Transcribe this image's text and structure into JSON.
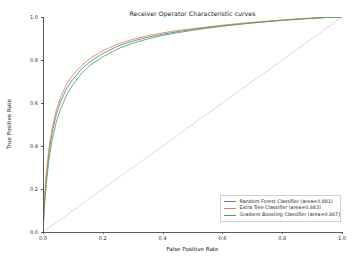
{
  "chart_data": {
    "type": "line",
    "title": "Receiver Operator Characteristic curves",
    "xlabel": "False Positive Rate",
    "ylabel": "True Positive Rate",
    "xlim": [
      0.0,
      1.0
    ],
    "ylim": [
      0.0,
      1.0
    ],
    "grid": false,
    "legend_position": "lower right",
    "xticks": [
      "0.0",
      "0.2",
      "0.4",
      "0.6",
      "0.8",
      "1.0"
    ],
    "xtick_values": [
      0.0,
      0.2,
      0.4,
      0.6,
      0.8,
      1.0
    ],
    "yticks": [
      "0.0",
      "0.2",
      "0.4",
      "0.6",
      "0.8",
      "1.0"
    ],
    "ytick_values": [
      0.0,
      0.2,
      0.4,
      0.6,
      0.8,
      1.0
    ],
    "series": [
      {
        "name": "Random Forest Classifier  (area=0.881)",
        "label": "Random Forest Classifier",
        "area": 0.881,
        "color": "#5a7ca8",
        "x": [
          0.0,
          0.004,
          0.008,
          0.013,
          0.02,
          0.03,
          0.045,
          0.06,
          0.08,
          0.1,
          0.13,
          0.16,
          0.2,
          0.25,
          0.3,
          0.35,
          0.4,
          0.45,
          0.5,
          0.55,
          0.6,
          0.65,
          0.7,
          0.75,
          0.8,
          0.85,
          0.9,
          0.95,
          1.0
        ],
        "y": [
          0.0,
          0.12,
          0.2,
          0.28,
          0.37,
          0.46,
          0.55,
          0.61,
          0.67,
          0.71,
          0.76,
          0.795,
          0.83,
          0.865,
          0.888,
          0.906,
          0.92,
          0.932,
          0.942,
          0.951,
          0.959,
          0.966,
          0.973,
          0.979,
          0.985,
          0.99,
          0.994,
          0.998,
          1.0
        ]
      },
      {
        "name": "Extra Tree Classifier  (area=0.883)",
        "label": "Extra Tree Classifier",
        "area": 0.883,
        "color": "#d98a47",
        "x": [
          0.0,
          0.004,
          0.008,
          0.013,
          0.02,
          0.03,
          0.045,
          0.06,
          0.08,
          0.1,
          0.13,
          0.16,
          0.2,
          0.25,
          0.3,
          0.35,
          0.4,
          0.45,
          0.5,
          0.55,
          0.6,
          0.65,
          0.7,
          0.75,
          0.8,
          0.85,
          0.9,
          0.95,
          1.0
        ],
        "y": [
          0.0,
          0.135,
          0.22,
          0.3,
          0.39,
          0.48,
          0.57,
          0.63,
          0.69,
          0.73,
          0.775,
          0.81,
          0.843,
          0.875,
          0.896,
          0.913,
          0.926,
          0.937,
          0.946,
          0.954,
          0.962,
          0.969,
          0.975,
          0.981,
          0.986,
          0.991,
          0.995,
          0.998,
          1.0
        ]
      },
      {
        "name": "Gradient Boosting Classifier  (area=0.867)",
        "label": "Gradient Boosting Classifier",
        "area": 0.867,
        "color": "#4f9e63",
        "x": [
          0.0,
          0.004,
          0.008,
          0.013,
          0.02,
          0.03,
          0.045,
          0.06,
          0.08,
          0.1,
          0.13,
          0.16,
          0.2,
          0.25,
          0.3,
          0.35,
          0.4,
          0.45,
          0.5,
          0.55,
          0.6,
          0.65,
          0.7,
          0.75,
          0.8,
          0.85,
          0.9,
          0.95,
          1.0
        ],
        "y": [
          0.0,
          0.1,
          0.175,
          0.25,
          0.335,
          0.425,
          0.515,
          0.575,
          0.64,
          0.685,
          0.74,
          0.778,
          0.815,
          0.852,
          0.878,
          0.898,
          0.914,
          0.927,
          0.938,
          0.948,
          0.957,
          0.965,
          0.972,
          0.978,
          0.984,
          0.989,
          0.994,
          0.998,
          1.0
        ]
      }
    ],
    "reference_line": {
      "name": "chance-diagonal",
      "color": "#c8c8c8",
      "x": [
        0.0,
        1.0
      ],
      "y": [
        0.0,
        1.0
      ]
    }
  }
}
